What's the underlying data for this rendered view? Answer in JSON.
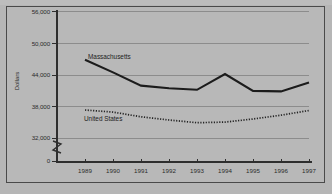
{
  "chart_data": {
    "type": "line",
    "title": "",
    "xlabel": "",
    "ylabel": "Dollars",
    "x": [
      "1989",
      "1990",
      "1991",
      "1992",
      "1993",
      "1994",
      "1995",
      "1996",
      "1997"
    ],
    "categories": [
      "1989",
      "1990",
      "1991",
      "1992",
      "1993",
      "1994",
      "1995",
      "1996",
      "1997"
    ],
    "ylim": [
      32000,
      56000
    ],
    "yticks": [
      "56,000",
      "50,000",
      "44,000",
      "38,000",
      "32,000",
      "0"
    ],
    "ytick_values": [
      56000,
      50000,
      44000,
      38000,
      32000,
      0
    ],
    "grid": true,
    "legend": "inline-annotations",
    "axis_break": true,
    "series": [
      {
        "name": "Massachusetts",
        "style": "solid-thick",
        "color": "#1c1c1c",
        "values": [
          46800,
          44400,
          41900,
          41400,
          41100,
          44100,
          40900,
          40800,
          42500
        ]
      },
      {
        "name": "United States",
        "style": "dotted",
        "color": "#242424",
        "values": [
          37300,
          36900,
          36000,
          35400,
          34900,
          35000,
          35600,
          36300,
          37200
        ]
      }
    ],
    "annotations": [
      {
        "text": "Massachusetts",
        "x": "1990",
        "y": 47200
      },
      {
        "text": "United States",
        "x": "1991",
        "y": 34300
      }
    ]
  },
  "axis": {
    "y_title": "Dollars",
    "zero_label": "0"
  }
}
